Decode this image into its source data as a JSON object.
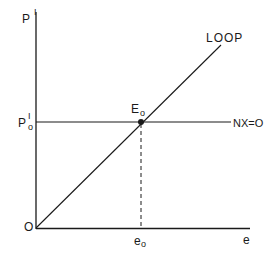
{
  "diagram": {
    "axes": {
      "y_label": "P",
      "y_label_sup": "I",
      "x_label": "e",
      "origin_label": "O"
    },
    "curves": {
      "loop_label": "LOOP",
      "nx_label": "NX=O"
    },
    "equilibrium": {
      "point_label": "E",
      "point_label_sub": "o",
      "y_tick_label": "P",
      "y_tick_sup": "I",
      "y_tick_sub": "o",
      "x_tick_label": "e",
      "x_tick_sub": "o"
    },
    "colors": {
      "ink": "#1a1a1a",
      "background": "#ffffff"
    }
  }
}
